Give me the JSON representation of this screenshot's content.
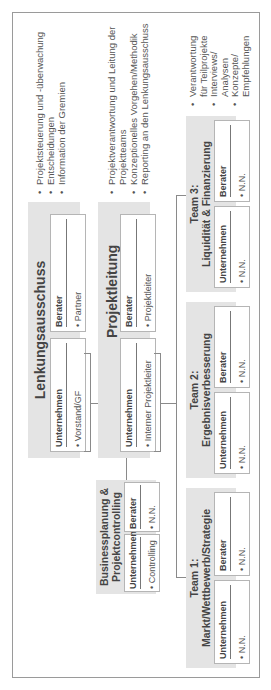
{
  "lenkungsausschuss": {
    "title": "Lenkungsausschuss",
    "unternehmen": {
      "label": "Unternehmen",
      "item": "• Vorstand/GF"
    },
    "berater": {
      "label": "Berater",
      "item": "• Partner"
    },
    "tasks": [
      "Projektsteuerung und -überwachung",
      "Entscheidungen",
      "Information der Gremien"
    ]
  },
  "projektleitung": {
    "title": "Projektleitung",
    "unternehmen": {
      "label": "Unternehmen",
      "item": "• Interner Projektleiter"
    },
    "berater": {
      "label": "Berater",
      "item": "• Projektleiter"
    },
    "tasks": [
      "Projektverantwortung und Leitung der",
      "Projektteams",
      "Konzeptionelles Vorgehen/Methodik",
      "Reporting an den Lenkungsausschuss"
    ]
  },
  "controlling": {
    "title_line1": "Businessplanung &",
    "title_line2": "Projektcontrolling",
    "unternehmen": {
      "label": "Unternehmen",
      "item": "• Controlling"
    },
    "berater": {
      "label": "Berater",
      "item": "• N.N."
    }
  },
  "teams": [
    {
      "title_line1": "Team 1:",
      "title_line2": "Markt/Wettbewerb/Strategie",
      "unternehmen": {
        "label": "Unternehmen",
        "item": "• N.N."
      },
      "berater": {
        "label": "Berater",
        "item": "• N.N."
      }
    },
    {
      "title_line1": "Team 2:",
      "title_line2": "Ergebnisverbesserung",
      "unternehmen": {
        "label": "Unternehmen",
        "item": "• N.N."
      },
      "berater": {
        "label": "Berater",
        "item": "• N.N."
      }
    },
    {
      "title_line1": "Team 3:",
      "title_line2": "Liquidität & Finanzierung",
      "unternehmen": {
        "label": "Unternehmen",
        "item": "• N.N."
      },
      "berater": {
        "label": "Berater",
        "item": "• N.N."
      }
    }
  ],
  "team_tasks": [
    "Verantwortung",
    "für Teilprojekte",
    "Interviews/",
    "Analysen",
    "Konzepte/",
    "Empfehlungen"
  ]
}
